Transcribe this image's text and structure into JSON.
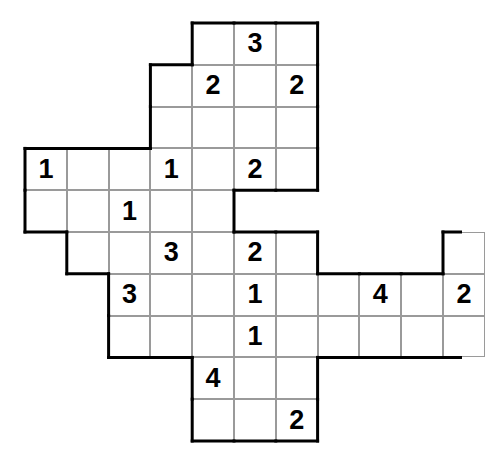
{
  "puzzle": {
    "title": "Number Grid Puzzle",
    "grid": {
      "origin_x": 25,
      "origin_y": 23,
      "cell_size": 41.8,
      "columns": 11,
      "rows": 11,
      "border_color": "#000000",
      "gridline_color": "#9a9a9a",
      "cell_fill": "#ffffff",
      "digit_color": "#000000"
    },
    "cells": [
      {
        "id": "c-r0-c4",
        "row": 0,
        "col": 4,
        "value": ""
      },
      {
        "id": "c-r0-c5",
        "row": 0,
        "col": 5,
        "value": "3"
      },
      {
        "id": "c-r0-c6",
        "row": 0,
        "col": 6,
        "value": ""
      },
      {
        "id": "c-r1-c3",
        "row": 1,
        "col": 3,
        "value": ""
      },
      {
        "id": "c-r1-c4",
        "row": 1,
        "col": 4,
        "value": "2"
      },
      {
        "id": "c-r1-c5",
        "row": 1,
        "col": 5,
        "value": ""
      },
      {
        "id": "c-r1-c6",
        "row": 1,
        "col": 6,
        "value": "2"
      },
      {
        "id": "c-r2-c3",
        "row": 2,
        "col": 3,
        "value": ""
      },
      {
        "id": "c-r2-c4",
        "row": 2,
        "col": 4,
        "value": ""
      },
      {
        "id": "c-r2-c5",
        "row": 2,
        "col": 5,
        "value": ""
      },
      {
        "id": "c-r2-c6",
        "row": 2,
        "col": 6,
        "value": ""
      },
      {
        "id": "c-r3-c0",
        "row": 3,
        "col": 0,
        "value": "1"
      },
      {
        "id": "c-r3-c1",
        "row": 3,
        "col": 1,
        "value": ""
      },
      {
        "id": "c-r3-c2",
        "row": 3,
        "col": 2,
        "value": ""
      },
      {
        "id": "c-r3-c3",
        "row": 3,
        "col": 3,
        "value": "1"
      },
      {
        "id": "c-r3-c4",
        "row": 3,
        "col": 4,
        "value": ""
      },
      {
        "id": "c-r3-c5",
        "row": 3,
        "col": 5,
        "value": "2"
      },
      {
        "id": "c-r3-c6",
        "row": 3,
        "col": 6,
        "value": ""
      },
      {
        "id": "c-r4-c0",
        "row": 4,
        "col": 0,
        "value": ""
      },
      {
        "id": "c-r4-c1",
        "row": 4,
        "col": 1,
        "value": ""
      },
      {
        "id": "c-r4-c2",
        "row": 4,
        "col": 2,
        "value": "1"
      },
      {
        "id": "c-r4-c3",
        "row": 4,
        "col": 3,
        "value": ""
      },
      {
        "id": "c-r4-c4",
        "row": 4,
        "col": 4,
        "value": ""
      },
      {
        "id": "c-r5-c1",
        "row": 5,
        "col": 1,
        "value": ""
      },
      {
        "id": "c-r5-c2",
        "row": 5,
        "col": 2,
        "value": ""
      },
      {
        "id": "c-r5-c3",
        "row": 5,
        "col": 3,
        "value": "3"
      },
      {
        "id": "c-r5-c4",
        "row": 5,
        "col": 4,
        "value": ""
      },
      {
        "id": "c-r5-c5",
        "row": 5,
        "col": 5,
        "value": "2"
      },
      {
        "id": "c-r5-c6",
        "row": 5,
        "col": 6,
        "value": ""
      },
      {
        "id": "c-r5-c10",
        "row": 5,
        "col": 10,
        "value": ""
      },
      {
        "id": "c-r6-c2",
        "row": 6,
        "col": 2,
        "value": "3"
      },
      {
        "id": "c-r6-c3",
        "row": 6,
        "col": 3,
        "value": ""
      },
      {
        "id": "c-r6-c4",
        "row": 6,
        "col": 4,
        "value": ""
      },
      {
        "id": "c-r6-c5",
        "row": 6,
        "col": 5,
        "value": "1"
      },
      {
        "id": "c-r6-c6",
        "row": 6,
        "col": 6,
        "value": ""
      },
      {
        "id": "c-r6-c7",
        "row": 6,
        "col": 7,
        "value": ""
      },
      {
        "id": "c-r6-c8",
        "row": 6,
        "col": 8,
        "value": "4"
      },
      {
        "id": "c-r6-c9",
        "row": 6,
        "col": 9,
        "value": ""
      },
      {
        "id": "c-r6-c10",
        "row": 6,
        "col": 10,
        "value": "2"
      },
      {
        "id": "c-r7-c2",
        "row": 7,
        "col": 2,
        "value": ""
      },
      {
        "id": "c-r7-c3",
        "row": 7,
        "col": 3,
        "value": ""
      },
      {
        "id": "c-r7-c4",
        "row": 7,
        "col": 4,
        "value": ""
      },
      {
        "id": "c-r7-c5",
        "row": 7,
        "col": 5,
        "value": "1"
      },
      {
        "id": "c-r7-c6",
        "row": 7,
        "col": 6,
        "value": ""
      },
      {
        "id": "c-r7-c7",
        "row": 7,
        "col": 7,
        "value": ""
      },
      {
        "id": "c-r7-c8",
        "row": 7,
        "col": 8,
        "value": ""
      },
      {
        "id": "c-r7-c9",
        "row": 7,
        "col": 9,
        "value": ""
      },
      {
        "id": "c-r7-c10",
        "row": 7,
        "col": 10,
        "value": ""
      },
      {
        "id": "c-r8-c4",
        "row": 8,
        "col": 4,
        "value": "4"
      },
      {
        "id": "c-r8-c5",
        "row": 8,
        "col": 5,
        "value": ""
      },
      {
        "id": "c-r8-c6",
        "row": 8,
        "col": 6,
        "value": ""
      },
      {
        "id": "c-r9-c4",
        "row": 9,
        "col": 4,
        "value": ""
      },
      {
        "id": "c-r9-c5",
        "row": 9,
        "col": 5,
        "value": ""
      },
      {
        "id": "c-r9-c6",
        "row": 9,
        "col": 6,
        "value": "2"
      }
    ],
    "clues": [
      {
        "row": 0,
        "col": 5,
        "value": "3"
      },
      {
        "row": 1,
        "col": 4,
        "value": "2"
      },
      {
        "row": 1,
        "col": 6,
        "value": "2"
      },
      {
        "row": 3,
        "col": 0,
        "value": "1"
      },
      {
        "row": 3,
        "col": 3,
        "value": "1"
      },
      {
        "row": 3,
        "col": 5,
        "value": "2"
      },
      {
        "row": 4,
        "col": 2,
        "value": "1"
      },
      {
        "row": 5,
        "col": 3,
        "value": "3"
      },
      {
        "row": 5,
        "col": 5,
        "value": "2"
      },
      {
        "row": 6,
        "col": 2,
        "value": "3"
      },
      {
        "row": 6,
        "col": 5,
        "value": "1"
      },
      {
        "row": 6,
        "col": 8,
        "value": "4"
      },
      {
        "row": 6,
        "col": 10,
        "value": "2"
      },
      {
        "row": 7,
        "col": 5,
        "value": "1"
      },
      {
        "row": 8,
        "col": 4,
        "value": "4"
      },
      {
        "row": 9,
        "col": 6,
        "value": "2"
      }
    ]
  }
}
